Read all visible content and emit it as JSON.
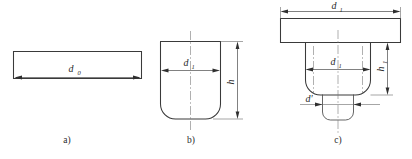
{
  "figure": {
    "background_color": "#ffffff",
    "line_color": "#3a3a3a",
    "text_color": "#2b2b2b",
    "panels": [
      {
        "id": "a",
        "caption": "a)",
        "description": "flat circular blank shown in side elevation as a thin rectangle",
        "dimensions": [
          {
            "name": "blank-diameter",
            "symbol": "d",
            "subscript": "0",
            "orientation": "horizontal"
          }
        ]
      },
      {
        "id": "b",
        "caption": "b)",
        "description": "drawn cup with rounded bottom corners",
        "dimensions": [
          {
            "name": "cup-diameter",
            "symbol": "d",
            "subscript": "1",
            "orientation": "horizontal"
          },
          {
            "name": "cup-height",
            "symbol": "h",
            "subscript": "",
            "orientation": "vertical"
          }
        ]
      },
      {
        "id": "c",
        "caption": "c)",
        "description": "drawn part with flange, rounded bottom and lower redrawn step",
        "dimensions": [
          {
            "name": "flange-diameter",
            "symbol": "d",
            "subscript": "1",
            "orientation": "horizontal"
          },
          {
            "name": "body-diameter",
            "symbol": "d",
            "subscript": "1",
            "orientation": "horizontal"
          },
          {
            "name": "step-diameter",
            "symbol": "d′",
            "subscript": "",
            "orientation": "horizontal"
          },
          {
            "name": "body-height",
            "symbol": "h",
            "subscript": "1",
            "orientation": "vertical"
          }
        ]
      }
    ]
  },
  "labels": {
    "d0": "d",
    "d0_sub": "0",
    "b_d1": "d",
    "b_d1_sub": "1",
    "b_h": "h",
    "c_d1_top": "d",
    "c_d1_top_sub": "1",
    "c_d1_mid": "d",
    "c_d1_mid_sub": "1",
    "c_dprime": "d′",
    "c_h1": "h",
    "c_h1_sub": "1",
    "caption_a": "a)",
    "caption_b": "b)",
    "caption_c": "c)"
  }
}
